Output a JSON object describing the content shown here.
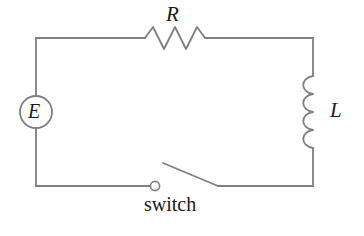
{
  "figure": {
    "kind": "electrical-circuit-schematic",
    "width": 364,
    "height": 236,
    "background_color": "#ffffff",
    "line_color": "#7f7f7f",
    "text_color": "#1a1a1a"
  },
  "labels": {
    "resistor": "R",
    "inductor": "L",
    "source": "E",
    "switch": "switch"
  },
  "components": [
    {
      "id": "source",
      "name": "emf-source",
      "symbol": "circle-with-letter",
      "label": "E",
      "position": "left-branch",
      "center": [
        36,
        112
      ],
      "radius": 16
    },
    {
      "id": "resistor",
      "name": "resistor",
      "symbol": "zigzag",
      "label": "R",
      "position": "top-branch",
      "peaks": 3,
      "span": [
        145,
        210
      ],
      "baseline_y": 38
    },
    {
      "id": "inductor",
      "name": "inductor",
      "symbol": "coil-loops",
      "label": "L",
      "position": "right-branch",
      "loops": 4,
      "span_y": [
        76,
        148
      ],
      "baseline_x": 313
    },
    {
      "id": "switch",
      "name": "switch",
      "symbol": "open-knife-switch",
      "label": "switch",
      "position": "bottom-branch",
      "state": "open",
      "terminal": [
        155,
        186
      ],
      "blade": [
        [
          163,
          163
        ],
        [
          218,
          186
        ]
      ]
    }
  ],
  "loop": {
    "name": "circuit-loop",
    "corners": {
      "top_left": [
        36,
        38
      ],
      "top_right": [
        313,
        38
      ],
      "bottom_right": [
        313,
        186
      ],
      "bottom_left": [
        36,
        186
      ]
    }
  }
}
